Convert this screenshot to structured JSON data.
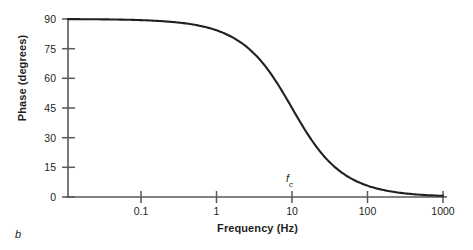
{
  "figure": {
    "panel_label": "b"
  },
  "chart_data": {
    "type": "line",
    "title": "",
    "subtitle": "",
    "xlabel": "Frequency (Hz)",
    "ylabel": "Phase (degrees)",
    "xscale": "log",
    "yscale": "linear",
    "xlim": [
      0.03,
      1000
    ],
    "ylim": [
      0,
      90
    ],
    "grid": false,
    "legend": null,
    "xticks": [
      0.1,
      1,
      10,
      100,
      1000
    ],
    "xticklabels": [
      "0.1",
      "1",
      "10",
      "100",
      "1000"
    ],
    "yticks": [
      0,
      15,
      30,
      45,
      60,
      75,
      90
    ],
    "yticklabels": [
      "0",
      "15",
      "30",
      "45",
      "60",
      "75",
      "90"
    ],
    "annotations": [
      {
        "name": "cutoff-frequency",
        "text": "f",
        "subscript": "c",
        "x": 10,
        "y": 8,
        "description": "cutoff frequency marker above the 10 Hz tick"
      }
    ],
    "series": [
      {
        "name": "phase",
        "formula": "phase = arctan(fc / f), fc = 10 Hz",
        "line_color": "#231f20",
        "line_width": 2,
        "x": [
          0.03,
          0.05,
          0.08,
          0.1,
          0.15,
          0.2,
          0.3,
          0.5,
          0.7,
          1,
          1.5,
          2,
          3,
          5,
          7,
          10,
          15,
          20,
          30,
          50,
          70,
          100,
          150,
          200,
          300,
          500,
          700,
          1000
        ],
        "y": [
          90,
          89.7,
          89.5,
          89.4,
          89.1,
          88.9,
          88.3,
          87.1,
          86,
          84.3,
          81.5,
          78.7,
          73.3,
          63.4,
          55,
          45,
          33.7,
          26.6,
          18.4,
          11.3,
          8.1,
          5.7,
          3.8,
          2.9,
          1.9,
          1.1,
          0.8,
          0.6
        ]
      }
    ]
  },
  "colors": {
    "axis": "#58595b",
    "curve": "#231f20",
    "text": "#231f20",
    "background": "#ffffff"
  }
}
